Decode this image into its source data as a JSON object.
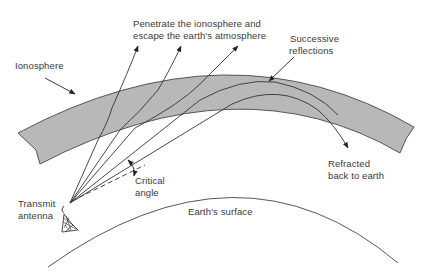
{
  "diagram": {
    "labels": {
      "penetrate_line1": "Penetrate the ionosphere and",
      "penetrate_line2": "escape the earth's atmosphere",
      "ionosphere": "Ionosphere",
      "successive_line1": "Successive",
      "successive_line2": "reflections",
      "critical_line1": "Critical",
      "critical_line2": "angle",
      "transmit_line1": "Transmit",
      "transmit_line2": "antenna",
      "refracted_line1": "Refracted",
      "refracted_line2": "back to earth",
      "earth_surface": "Earth's surface"
    },
    "colors": {
      "ionosphere_fill": "#b8b8b8",
      "line": "#333333",
      "text": "#3a3a3a"
    },
    "nodes": [
      "Transmit antenna",
      "Ionosphere",
      "Earth's surface"
    ],
    "rays": [
      {
        "name": "ray-escape-1",
        "outcome": "Penetrate the ionosphere and escape"
      },
      {
        "name": "ray-escape-2",
        "outcome": "Penetrate the ionosphere and escape"
      },
      {
        "name": "ray-escape-3",
        "outcome": "Penetrate the ionosphere and escape"
      },
      {
        "name": "ray-successive",
        "outcome": "Successive reflections"
      },
      {
        "name": "ray-refracted",
        "outcome": "Refracted back to earth"
      },
      {
        "name": "ray-critical",
        "outcome": "Critical angle reference (dashed)"
      }
    ]
  }
}
